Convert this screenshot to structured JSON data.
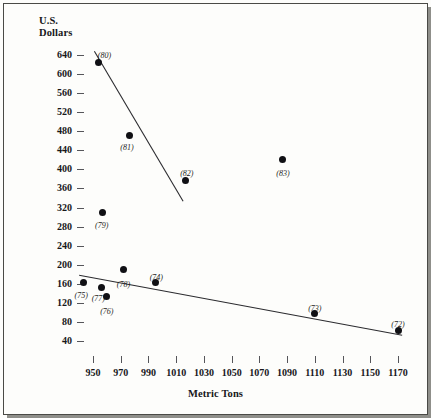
{
  "figure": {
    "background_color": "#fdfdfb",
    "border_color": "#4a4a46"
  },
  "chart_data": {
    "type": "scatter",
    "title": "",
    "ylabel_line1": "U.S.",
    "ylabel_line2": "Dollars",
    "xlabel": "Metric Tons",
    "ylabel": "U.S. Dollars",
    "xlim": [
      935,
      1180
    ],
    "ylim": [
      20,
      660
    ],
    "grid": false,
    "legend": null,
    "yticks": [
      640,
      600,
      560,
      520,
      480,
      440,
      400,
      360,
      320,
      280,
      240,
      200,
      160,
      120,
      80,
      40
    ],
    "xticks": [
      950,
      970,
      990,
      1010,
      1030,
      1050,
      1070,
      1090,
      1110,
      1130,
      1150,
      1170
    ],
    "point_color": "#101014",
    "line_color": "#2b2b2f",
    "points": [
      {
        "label": "(80)",
        "x": 954,
        "y": 625,
        "label_dx": 6,
        "label_dy": -11
      },
      {
        "label": "(81)",
        "x": 976,
        "y": 472,
        "label_dx": -2,
        "label_dy": 8
      },
      {
        "label": "(82)",
        "x": 1017,
        "y": 377,
        "label_dx": 1,
        "label_dy": -11
      },
      {
        "label": "(83)",
        "x": 1087,
        "y": 420,
        "label_dx": 0,
        "label_dy": 9
      },
      {
        "label": "(79)",
        "x": 957,
        "y": 310,
        "label_dx": -1,
        "label_dy": 9
      },
      {
        "label": "(75)",
        "x": 943,
        "y": 163,
        "label_dx": -2,
        "label_dy": 9
      },
      {
        "label": "(77)",
        "x": 956,
        "y": 152,
        "label_dx": -3,
        "label_dy": 6
      },
      {
        "label": "(76)",
        "x": 960,
        "y": 133,
        "label_dx": 0,
        "label_dy": 10
      },
      {
        "label": "(78)",
        "x": 972,
        "y": 190,
        "label_dx": 0,
        "label_dy": 10
      },
      {
        "label": "(74)",
        "x": 995,
        "y": 162,
        "label_dx": 1,
        "label_dy": -10
      },
      {
        "label": "(73)",
        "x": 1110,
        "y": 97,
        "label_dx": 0,
        "label_dy": -10
      },
      {
        "label": "(72)",
        "x": 1170,
        "y": 63,
        "label_dx": 0,
        "label_dy": -10
      }
    ],
    "trendlines": [
      {
        "name": "upper-regression-line",
        "x1": 951,
        "y1": 648,
        "x2": 1015,
        "y2": 333
      },
      {
        "name": "lower-regression-line",
        "x1": 940,
        "y1": 178,
        "x2": 1173,
        "y2": 52
      }
    ]
  }
}
